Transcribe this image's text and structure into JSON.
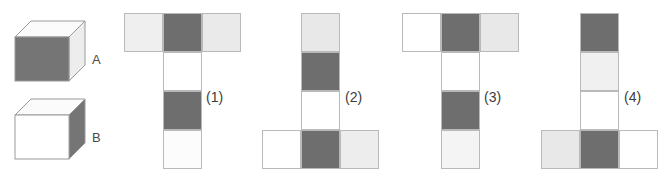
{
  "palette": {
    "dark_gray": "#6e6e6e",
    "light_gray": "#e6e6e6",
    "white": "#ffffff",
    "very_light_gray": "#f2f2f2",
    "outline": "#b9b9b9",
    "cube_outline": "#9a9a9a",
    "text": "#3c3c3c",
    "background": "#ffffff"
  },
  "cubes": [
    {
      "id": "cube-a",
      "label": "A",
      "faces": {
        "front": "#757575",
        "top": "#fbfbfb",
        "right": "#ededed"
      },
      "description": "cube with dark gray front face, white top face, light gray right face"
    },
    {
      "id": "cube-b",
      "label": "B",
      "faces": {
        "front": "#ffffff",
        "top": "#fbfbfb",
        "right": "#757575"
      },
      "description": "cube with white front face, white top face, dark gray right face"
    }
  ],
  "nets": [
    {
      "id": "net-1",
      "label": "(1)",
      "shape": "T-shape: horizontal row of 3 on top, vertical column of 3 below the middle square",
      "cells": [
        {
          "row": 0,
          "col": 0,
          "color": "#efefef",
          "name": "light-gray"
        },
        {
          "row": 0,
          "col": 1,
          "color": "#6e6e6e",
          "name": "dark-gray"
        },
        {
          "row": 0,
          "col": 2,
          "color": "#eaeaea",
          "name": "light-gray"
        },
        {
          "row": 1,
          "col": 1,
          "color": "#ffffff",
          "name": "white"
        },
        {
          "row": 2,
          "col": 1,
          "color": "#6e6e6e",
          "name": "dark-gray"
        },
        {
          "row": 3,
          "col": 1,
          "color": "#fcfcfc",
          "name": "white"
        }
      ]
    },
    {
      "id": "net-2",
      "label": "(2)",
      "shape": "vertical column of 4 with a horizontal row of 3 across the bottom square",
      "cells": [
        {
          "row": 0,
          "col": 1,
          "color": "#e8e8e8",
          "name": "light-gray"
        },
        {
          "row": 1,
          "col": 1,
          "color": "#6e6e6e",
          "name": "dark-gray"
        },
        {
          "row": 2,
          "col": 1,
          "color": "#ffffff",
          "name": "white"
        },
        {
          "row": 3,
          "col": 0,
          "color": "#ffffff",
          "name": "white"
        },
        {
          "row": 3,
          "col": 1,
          "color": "#6e6e6e",
          "name": "dark-gray"
        },
        {
          "row": 3,
          "col": 2,
          "color": "#ededed",
          "name": "light-gray"
        }
      ]
    },
    {
      "id": "net-3",
      "label": "(3)",
      "shape": "T-shape: horizontal row of 3 on top, vertical column of 3 below the middle square",
      "cells": [
        {
          "row": 0,
          "col": 0,
          "color": "#ffffff",
          "name": "white"
        },
        {
          "row": 0,
          "col": 1,
          "color": "#6e6e6e",
          "name": "dark-gray"
        },
        {
          "row": 0,
          "col": 2,
          "color": "#e8e8e8",
          "name": "light-gray"
        },
        {
          "row": 1,
          "col": 1,
          "color": "#ffffff",
          "name": "white"
        },
        {
          "row": 2,
          "col": 1,
          "color": "#6e6e6e",
          "name": "dark-gray"
        },
        {
          "row": 3,
          "col": 1,
          "color": "#f4f4f4",
          "name": "very-light-gray"
        }
      ]
    },
    {
      "id": "net-4",
      "label": "(4)",
      "shape": "vertical column of 4 with a horizontal row of 3 across the bottom square",
      "cells": [
        {
          "row": 0,
          "col": 1,
          "color": "#6e6e6e",
          "name": "dark-gray"
        },
        {
          "row": 1,
          "col": 1,
          "color": "#f0f0f0",
          "name": "light-gray"
        },
        {
          "row": 2,
          "col": 1,
          "color": "#ffffff",
          "name": "white"
        },
        {
          "row": 3,
          "col": 0,
          "color": "#e8e8e8",
          "name": "light-gray"
        },
        {
          "row": 3,
          "col": 1,
          "color": "#6e6e6e",
          "name": "dark-gray"
        },
        {
          "row": 3,
          "col": 2,
          "color": "#ffffff",
          "name": "white"
        }
      ]
    }
  ],
  "geometry": {
    "cell_size": 39,
    "net_origins_x": [
      124,
      262,
      402,
      541
    ],
    "net_origin_y": 13,
    "label_offsets": {
      "x": 82,
      "y": 78
    }
  }
}
